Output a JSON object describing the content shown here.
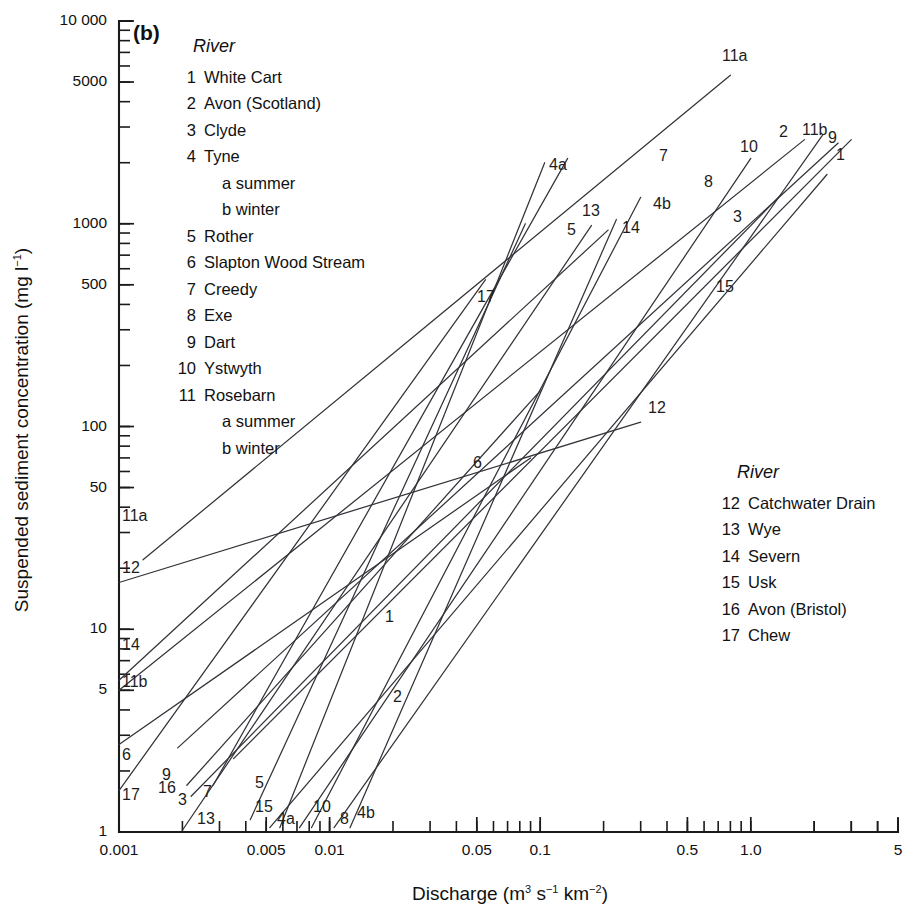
{
  "panel": {
    "label": "(b)"
  },
  "axes": {
    "x": {
      "title_main": "Discharge (m",
      "title_full": "Discharge (m3 s-1 km-2)",
      "sup1": "3",
      "mid": " s",
      "sup2": "−1",
      "mid2": " km",
      "sup3": "−2",
      "tail": ")",
      "min": 0.001,
      "max": 5,
      "scale": "log",
      "tick_labels": [
        "0.001",
        "0.005",
        "0.01",
        "0.05",
        "0.1",
        "0.5",
        "1.0",
        "5"
      ],
      "tick_values": [
        0.001,
        0.005,
        0.01,
        0.05,
        0.1,
        0.5,
        1.0,
        5
      ]
    },
    "y": {
      "title_main": "Suspended sediment concentration (mg l",
      "title_full": "Suspended sediment concentration (mg l-1)",
      "sup": "−1",
      "tail": ")",
      "min": 1,
      "max": 10000,
      "scale": "log",
      "tick_labels": [
        "1",
        "5",
        "10",
        "50",
        "100",
        "500",
        "1000",
        "5000",
        "10 000"
      ],
      "tick_values": [
        1,
        5,
        10,
        50,
        100,
        500,
        1000,
        5000,
        10000
      ]
    }
  },
  "legend_left": {
    "heading": "River",
    "entries": [
      {
        "num": "1",
        "name": "White Cart"
      },
      {
        "num": "2",
        "name": "Avon (Scotland)"
      },
      {
        "num": "3",
        "name": "Clyde"
      },
      {
        "num": "4",
        "name": "Tyne",
        "subs": [
          "a summer",
          "b winter"
        ]
      },
      {
        "num": "5",
        "name": "Rother"
      },
      {
        "num": "6",
        "name": "Slapton Wood Stream"
      },
      {
        "num": "7",
        "name": "Creedy"
      },
      {
        "num": "8",
        "name": "Exe"
      },
      {
        "num": "9",
        "name": "Dart"
      },
      {
        "num": "10",
        "name": "Ystwyth"
      },
      {
        "num": "11",
        "name": "Rosebarn",
        "subs": [
          "a summer",
          "b winter"
        ]
      }
    ]
  },
  "legend_right": {
    "heading": "River",
    "entries": [
      {
        "num": "12",
        "name": "Catchwater Drain"
      },
      {
        "num": "13",
        "name": "Wye"
      },
      {
        "num": "14",
        "name": "Severn"
      },
      {
        "num": "15",
        "name": "Usk"
      },
      {
        "num": "16",
        "name": "Avon (Bristol)"
      },
      {
        "num": "17",
        "name": "Chew"
      }
    ]
  },
  "colors": {
    "line": "#33343a",
    "axis": "#1a1a1a",
    "text": "#111111",
    "background": "#ffffff"
  },
  "chart_data": {
    "type": "line",
    "xlabel": "Discharge (m3 s-1 km-2)",
    "ylabel": "Suspended sediment concentration (mg l-1)",
    "xscale": "log",
    "yscale": "log",
    "xlim": [
      0.001,
      5
    ],
    "ylim": [
      1,
      10000
    ],
    "grid": false,
    "legend_position": "inside-top-left and inside-mid-right",
    "series": [
      {
        "name": "1",
        "river": "White Cart",
        "x": [
          0.0035,
          3.0
        ],
        "y": [
          2.3,
          2600
        ]
      },
      {
        "name": "2",
        "river": "Avon (Scotland)",
        "x": [
          0.0105,
          2.2
        ],
        "y": [
          1.05,
          2750
        ]
      },
      {
        "name": "3",
        "river": "Clyde",
        "x": [
          0.0022,
          1.4
        ],
        "y": [
          1.5,
          1400
        ]
      },
      {
        "name": "4a",
        "river": "Tyne (summer)",
        "x": [
          0.0058,
          0.105
        ],
        "y": [
          1.05,
          2000
        ]
      },
      {
        "name": "4b",
        "river": "Tyne (winter)",
        "x": [
          0.0125,
          0.23
        ],
        "y": [
          1.05,
          1050
        ]
      },
      {
        "name": "5",
        "river": "Rother",
        "x": [
          0.0042,
          0.085
        ],
        "y": [
          1.15,
          1000
        ]
      },
      {
        "name": "6",
        "river": "Slapton Wood Stream",
        "x": [
          0.001,
          0.09
        ],
        "y": [
          2.7,
          70
        ]
      },
      {
        "name": "7",
        "river": "Creedy",
        "x": [
          0.0028,
          0.135
        ],
        "y": [
          1.7,
          2100
        ]
      },
      {
        "name": "8",
        "river": "Exe",
        "x": [
          0.0082,
          0.3
        ],
        "y": [
          1.05,
          1350
        ]
      },
      {
        "name": "9",
        "river": "Dart",
        "x": [
          0.0019,
          2.6
        ],
        "y": [
          2.6,
          2500
        ]
      },
      {
        "name": "10",
        "river": "Ystwyth",
        "x": [
          0.0072,
          1.0
        ],
        "y": [
          1.05,
          2100
        ]
      },
      {
        "name": "11a",
        "river": "Rosebarn (summer)",
        "x": [
          0.0013,
          0.8
        ],
        "y": [
          22,
          5400
        ]
      },
      {
        "name": "11b",
        "river": "Rosebarn (winter)",
        "x": [
          0.001,
          1.8
        ],
        "y": [
          5.0,
          2600
        ]
      },
      {
        "name": "12",
        "river": "Catchwater Drain",
        "x": [
          0.001,
          0.3
        ],
        "y": [
          17,
          105
        ]
      },
      {
        "name": "13",
        "river": "Wye",
        "x": [
          0.002,
          0.175
        ],
        "y": [
          1.02,
          980
        ]
      },
      {
        "name": "14",
        "river": "Severn",
        "x": [
          0.001,
          0.21
        ],
        "y": [
          5.6,
          930
        ]
      },
      {
        "name": "15",
        "river": "Usk",
        "x": [
          0.0052,
          2.3
        ],
        "y": [
          1.05,
          1750
        ]
      },
      {
        "name": "16",
        "river": "Avon (Bristol)",
        "x": [
          0.0021,
          0.1
        ],
        "y": [
          1.7,
          150
        ]
      },
      {
        "name": "17",
        "river": "Chew",
        "x": [
          0.001,
          0.055
        ],
        "y": [
          1.6,
          530
        ]
      }
    ],
    "curve_labels": [
      {
        "text": "11a",
        "x": 122,
        "y": 521
      },
      {
        "text": "12",
        "x": 122,
        "y": 573
      },
      {
        "text": "14",
        "x": 122,
        "y": 650
      },
      {
        "text": "11b",
        "x": 122,
        "y": 687
      },
      {
        "text": "6",
        "x": 122,
        "y": 760
      },
      {
        "text": "17",
        "x": 122,
        "y": 800
      },
      {
        "text": "9",
        "x": 162,
        "y": 780
      },
      {
        "text": "16",
        "x": 158,
        "y": 793
      },
      {
        "text": "3",
        "x": 178,
        "y": 805
      },
      {
        "text": "7",
        "x": 203,
        "y": 797
      },
      {
        "text": "13",
        "x": 197,
        "y": 824
      },
      {
        "text": "5",
        "x": 255,
        "y": 788
      },
      {
        "text": "15",
        "x": 255,
        "y": 812
      },
      {
        "text": "4a",
        "x": 277,
        "y": 824
      },
      {
        "text": "10",
        "x": 313,
        "y": 812
      },
      {
        "text": "8",
        "x": 340,
        "y": 824
      },
      {
        "text": "4b",
        "x": 357,
        "y": 818
      },
      {
        "text": "1",
        "x": 385,
        "y": 622
      },
      {
        "text": "2",
        "x": 393,
        "y": 702
      },
      {
        "text": "6",
        "x": 473,
        "y": 468
      },
      {
        "text": "12",
        "x": 648,
        "y": 413
      },
      {
        "text": "17",
        "x": 477,
        "y": 302
      },
      {
        "text": "4a",
        "x": 549,
        "y": 170
      },
      {
        "text": "5",
        "x": 567,
        "y": 235
      },
      {
        "text": "13",
        "x": 582,
        "y": 216
      },
      {
        "text": "14",
        "x": 622,
        "y": 233
      },
      {
        "text": "7",
        "x": 659,
        "y": 161
      },
      {
        "text": "4b",
        "x": 653,
        "y": 209
      },
      {
        "text": "8",
        "x": 704,
        "y": 187
      },
      {
        "text": "11a",
        "x": 722,
        "y": 61
      },
      {
        "text": "3",
        "x": 733,
        "y": 222
      },
      {
        "text": "10",
        "x": 740,
        "y": 152
      },
      {
        "text": "15",
        "x": 716,
        "y": 292
      },
      {
        "text": "2",
        "x": 779,
        "y": 137
      },
      {
        "text": "11b",
        "x": 802,
        "y": 135
      },
      {
        "text": "9",
        "x": 828,
        "y": 143
      },
      {
        "text": "1",
        "x": 836,
        "y": 160
      }
    ]
  }
}
